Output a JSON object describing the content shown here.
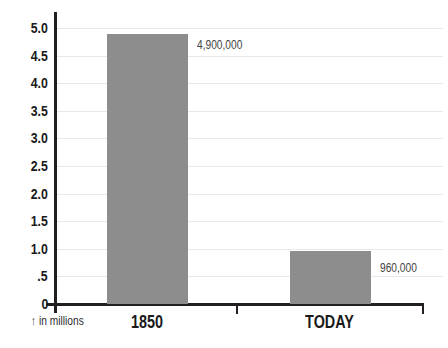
{
  "chart_data": {
    "type": "bar",
    "title": "",
    "xlabel": "",
    "ylabel": "",
    "categories": [
      "1850",
      "TODAY"
    ],
    "values": [
      4.9,
      0.96
    ],
    "value_labels": [
      "4,900,000",
      "960,000"
    ],
    "unit_arrow": "↑",
    "unit_note": "in millions",
    "ylim": [
      0,
      5.0
    ],
    "ytick_step": 0.5,
    "ytick_labels": [
      "0",
      ".5",
      "1.0",
      "1.5",
      "2.0",
      "2.5",
      "3.0",
      "3.5",
      "4.0",
      "4.5",
      "5.0"
    ],
    "grid": "horizontal",
    "legend": "none",
    "colors": {
      "bar": "#8d8d8d",
      "axis": "#231f20",
      "gridline": "#e9e9e9",
      "tick_label": "#1a1a1a",
      "value_label": "#3f3f3f",
      "background": "#ffffff"
    }
  }
}
